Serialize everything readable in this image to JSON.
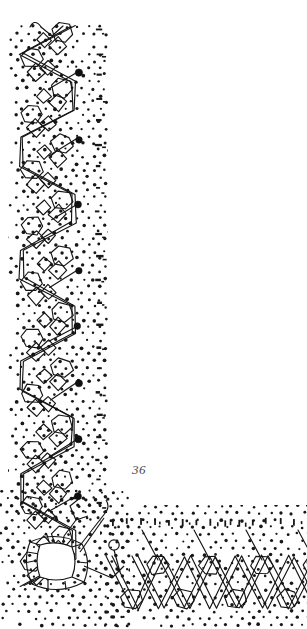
{
  "document": {
    "kind": "scanned-book-plate",
    "title": "Bobbin lace pricking pattern",
    "figure_number": "36",
    "page_background": "#ffffff",
    "ink_color": "#1a1a1a",
    "figure_number_color": "#4a4a4a"
  },
  "plate": {
    "width": 307,
    "height": 629,
    "description": "L-shaped lace border pricking: vertical band at left, horizontal band along bottom, joined by a corner motif",
    "bands": {
      "vertical": {
        "name": "vertical-border-band",
        "x_start": 8,
        "x_end": 108,
        "y_start": 24,
        "y_end": 520,
        "dot_grid_spacing": 11
      },
      "horizontal": {
        "name": "horizontal-border-band",
        "x_start": 100,
        "x_end": 307,
        "y_start": 505,
        "y_end": 629,
        "dot_grid_spacing": 11
      }
    },
    "motifs": {
      "serpentine_chain": {
        "name": "serpentine-cell-chain",
        "repeats": 9,
        "period_px": 56,
        "amplitude_px": 30
      },
      "pin_dots": {
        "name": "large-pin-dot",
        "count": 8,
        "radius_px": 3.2,
        "x": 78,
        "y_values": [
          73,
          139,
          205,
          271,
          327,
          383,
          440,
          496
        ]
      },
      "corner_ring": {
        "name": "corner-square-ring-motif",
        "cx": 56,
        "cy": 560,
        "size": 46
      },
      "bottom_zigzag": {
        "name": "bottom-diamond-lattice",
        "repeats": 4,
        "period_px": 52,
        "baseline_y": 605
      },
      "edge_ticks": {
        "name": "edge-tick-marks",
        "vertical_column_x": 96,
        "horizontal_row_y": 520,
        "count_vertical": 20,
        "count_horizontal": 14
      }
    }
  },
  "figure_label": {
    "name": "figure-number-label",
    "text": "36",
    "x": 132,
    "y": 470
  }
}
